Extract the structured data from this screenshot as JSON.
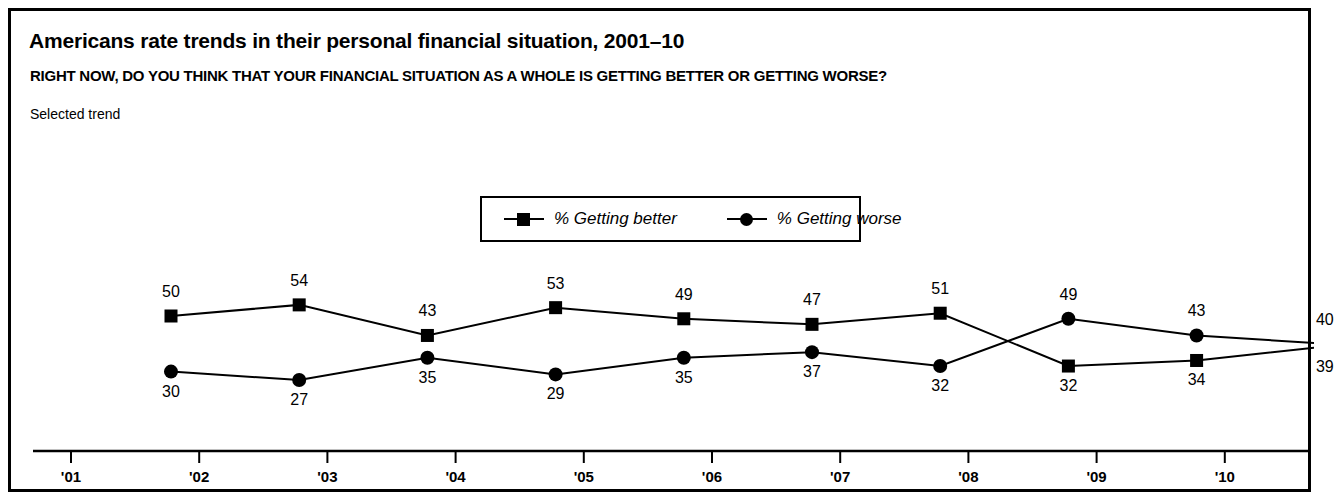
{
  "figure": {
    "title": "Americans rate trends in their personal financial situation, 2001–10",
    "question": "RIGHT NOW, DO YOU THINK THAT YOUR FINANCIAL SITUATION AS A WHOLE IS GETTING BETTER OR GETTING WORSE?",
    "note": "Selected trend",
    "border_color": "#000000",
    "background_color": "#ffffff"
  },
  "legend": {
    "position": "top-center",
    "items": [
      {
        "label": "% Getting better",
        "marker": "square",
        "color": "#000000"
      },
      {
        "label": "% Getting worse",
        "marker": "circle",
        "color": "#000000"
      }
    ]
  },
  "chart_data": {
    "type": "line",
    "title": "Americans rate trends in their personal financial situation, 2001–10",
    "subtitle": "RIGHT NOW, DO YOU THINK THAT YOUR FINANCIAL SITUATION AS A WHOLE IS GETTING BETTER OR GETTING WORSE?",
    "xlabel": "",
    "ylabel": "",
    "grid": false,
    "legend_position": "top-center",
    "categories": [
      "'01",
      "'02",
      "'03",
      "'04",
      "'05",
      "'06",
      "'07",
      "'08",
      "'09",
      "'10"
    ],
    "tick_labels": [
      "'01",
      "'02",
      "'03",
      "'04",
      "'05",
      "'06",
      "'07",
      "'08",
      "'09",
      "'10"
    ],
    "ylim": [
      0,
      60
    ],
    "series": [
      {
        "name": "% Getting better",
        "marker": "square",
        "color": "#000000",
        "values": [
          50,
          54,
          43,
          53,
          49,
          47,
          51,
          32,
          34,
          39
        ]
      },
      {
        "name": "% Getting worse",
        "marker": "circle",
        "color": "#000000",
        "values": [
          30,
          27,
          35,
          29,
          35,
          37,
          32,
          49,
          43,
          40
        ]
      }
    ]
  }
}
